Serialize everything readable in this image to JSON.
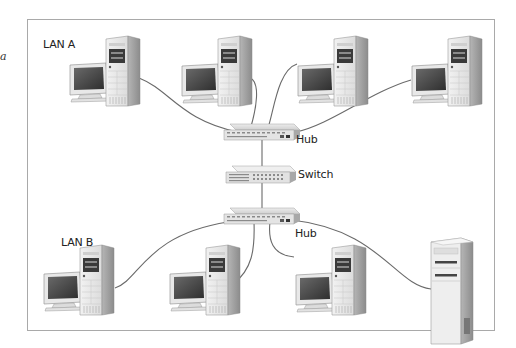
{
  "diagram": {
    "type": "network-topology",
    "edge_fragment": "a",
    "labels": {
      "lan_a": "LAN A",
      "lan_b": "LAN B",
      "hub_top": "Hub",
      "switch": "Switch",
      "hub_bottom": "Hub"
    },
    "lans": [
      {
        "name": "LAN A",
        "workstations": 4,
        "connected_to": "Hub (top)"
      },
      {
        "name": "LAN B",
        "workstations": 3,
        "servers": 1,
        "connected_to": "Hub (bottom)"
      }
    ],
    "links": [
      {
        "from": "Hub (top)",
        "to": "Switch"
      },
      {
        "from": "Switch",
        "to": "Hub (bottom)"
      }
    ],
    "colors": {
      "frame": "#a9a9a9",
      "cable": "#666666",
      "device_light": "#e6e6e6",
      "device_dark": "#9a9a9a",
      "screen": "#4a4a4a"
    }
  }
}
